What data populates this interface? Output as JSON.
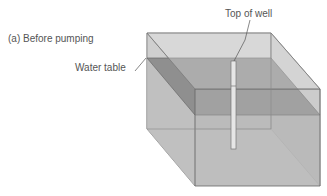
{
  "figure": {
    "panel_label": "(a) Before pumping",
    "labels": {
      "water_table": "Water table",
      "top_of_well": "Top of well"
    },
    "colors": {
      "box_light": "#d4d4d4",
      "box_mid": "#bdbdbd",
      "water_plane": "#8f8f8f",
      "edge": "#707070",
      "well": "#e8e8e8"
    }
  }
}
